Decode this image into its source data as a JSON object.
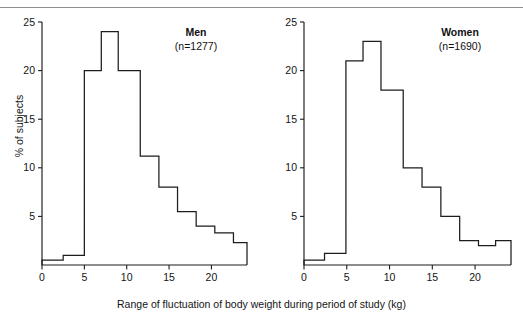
{
  "figure": {
    "axis_title_x": "Range of fluctuation of body weight during period of study (kg)",
    "axis_title_y": "% of subjects"
  },
  "panels": [
    {
      "id": "men",
      "title": "Men",
      "n_label": "(n=1277)",
      "y_ticks": [
        "5",
        "10",
        "15",
        "20",
        "25"
      ],
      "x_ticks": [
        "0",
        "5",
        "10",
        "15",
        "20"
      ]
    },
    {
      "id": "women",
      "title": "Women",
      "n_label": "(n=1690)",
      "y_ticks": [
        "5",
        "10",
        "15",
        "20",
        "25"
      ],
      "x_ticks": [
        "0",
        "5",
        "10",
        "15",
        "20"
      ]
    }
  ],
  "chart_data": [
    {
      "type": "bar",
      "title": "Men",
      "subtitle": "(n=1277)",
      "xlabel": "Range of fluctuation of body weight during period of study (kg)",
      "ylabel": "% of subjects",
      "xlim": [
        0,
        24.2
      ],
      "ylim": [
        0,
        25
      ],
      "ytick_values": [
        5,
        10,
        15,
        20,
        25
      ],
      "xtick_values": [
        0,
        5,
        10,
        15,
        20
      ],
      "grid": false,
      "legend": "none",
      "bin_edges": [
        0,
        2.5,
        3.5,
        5,
        7,
        9,
        11.6,
        13.8,
        16,
        18.2,
        20.4,
        22.6,
        24.2
      ],
      "values": [
        0.5,
        1.0,
        1.0,
        20.0,
        24.0,
        20.0,
        11.2,
        8.0,
        5.5,
        4.0,
        3.3,
        2.3
      ]
    },
    {
      "type": "bar",
      "title": "Women",
      "subtitle": "(n=1690)",
      "xlabel": "Range of fluctuation of body weight during period of study (kg)",
      "ylabel": "% of subjects",
      "xlim": [
        0,
        24.2
      ],
      "ylim": [
        0,
        25
      ],
      "ytick_values": [
        5,
        10,
        15,
        20,
        25
      ],
      "xtick_values": [
        0,
        5,
        10,
        15,
        20
      ],
      "grid": false,
      "legend": "none",
      "bin_edges": [
        0,
        2.4,
        3.4,
        4.9,
        6.9,
        9.0,
        11.6,
        13.8,
        16.0,
        18.2,
        20.4,
        22.4,
        24.2
      ],
      "values": [
        0.5,
        1.2,
        1.2,
        21.0,
        23.0,
        18.0,
        10.0,
        8.0,
        5.0,
        2.5,
        2.0,
        2.5
      ]
    }
  ]
}
